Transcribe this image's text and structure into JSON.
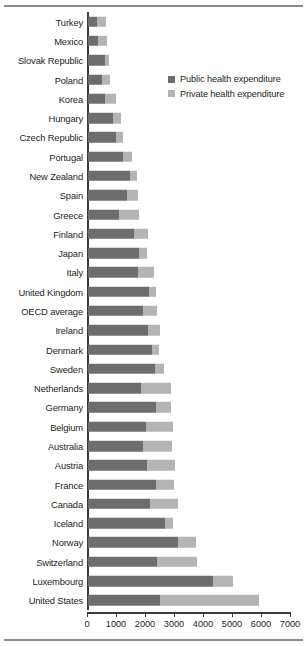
{
  "chart_data": {
    "type": "bar",
    "orientation": "horizontal",
    "stacked": true,
    "title": "",
    "xlabel": "",
    "ylabel": "",
    "xlim": [
      0,
      7000
    ],
    "xticks": [
      0,
      1000,
      2000,
      3000,
      4000,
      5000,
      6000,
      7000
    ],
    "xtick_labels": [
      "0",
      "1000",
      "2000",
      "3000",
      "4000",
      "5000",
      "6000",
      "7000"
    ],
    "grid": false,
    "legend_position": "upper right",
    "colors": {
      "public": "#6d6d6d",
      "private": "#b4b4b4",
      "axis": "#3a3a3a",
      "rule": "#8c8c8c",
      "text": "#231f20"
    },
    "series": [
      {
        "name": "Public health expenditure",
        "color": "#6d6d6d",
        "values": [
          310,
          345,
          590,
          480,
          590,
          860,
          965,
          1210,
          1450,
          1345,
          1070,
          1585,
          1760,
          1725,
          2100,
          1900,
          2070,
          2205,
          2310,
          1830,
          2345,
          2000,
          1900,
          2035,
          2345,
          2140,
          2655,
          3105,
          2380,
          4310,
          2480
        ]
      },
      {
        "name": "Private health expenditure",
        "color": "#b4b4b4",
        "values": [
          310,
          310,
          140,
          275,
          380,
          275,
          240,
          310,
          240,
          380,
          690,
          480,
          275,
          550,
          240,
          480,
          415,
          240,
          310,
          1035,
          515,
          930,
          1000,
          965,
          620,
          965,
          275,
          620,
          1380,
          690,
          3415
        ]
      }
    ],
    "categories": [
      "Turkey",
      "Mexico",
      "Slovak Republic",
      "Poland",
      "Korea",
      "Hungary",
      "Czech Republic",
      "Portugal",
      "New Zealand",
      "Spain",
      "Greece",
      "Finland",
      "Japan",
      "Italy",
      "United Kingdom",
      "OECD average",
      "Ireland",
      "Denmark",
      "Sweden",
      "Netherlands",
      "Germany",
      "Belgium",
      "Australia",
      "Austria",
      "France",
      "Canada",
      "Iceland",
      "Norway",
      "Switzerland",
      "Luxembourg",
      "United States"
    ],
    "totals": [
      620,
      655,
      730,
      755,
      970,
      1135,
      1205,
      1520,
      1690,
      1725,
      1760,
      2065,
      2035,
      2275,
      2340,
      2380,
      2485,
      2445,
      2620,
      2865,
      2860,
      2930,
      2900,
      3000,
      2965,
      3105,
      2930,
      3725,
      3760,
      5000,
      5895
    ]
  },
  "legend": {
    "items": [
      {
        "label": "Public health expenditure",
        "swatch": "public"
      },
      {
        "label": "Private health expenditure",
        "swatch": "private"
      }
    ]
  }
}
